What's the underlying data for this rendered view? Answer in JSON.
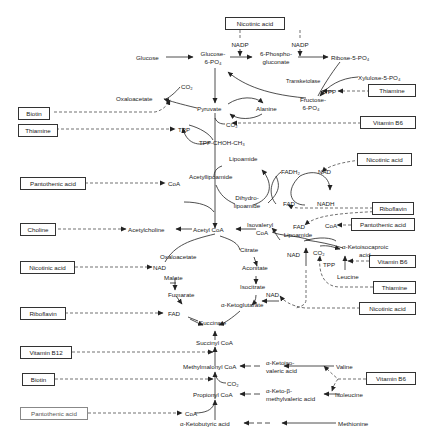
{
  "diagram": {
    "title": "",
    "vitamins": [
      {
        "id": "niacin_top",
        "label": "Nicotinic acid"
      },
      {
        "id": "biotin_1",
        "label": "Biotin"
      },
      {
        "id": "thiamine_1",
        "label": "Thiamine"
      },
      {
        "id": "thiamine_2",
        "label": "Thiamine"
      },
      {
        "id": "b6_1",
        "label": "Vitamin B6"
      },
      {
        "id": "pantothenic_1",
        "label": "Pantothenic acid"
      },
      {
        "id": "niacin_2",
        "label": "Nicotinic acid"
      },
      {
        "id": "choline",
        "label": "Choline"
      },
      {
        "id": "riboflavin_1",
        "label": "Riboflavin"
      },
      {
        "id": "pantothenic_2",
        "label": "Pantothenic acid"
      },
      {
        "id": "niacin_3",
        "label": "Nicotinic acid"
      },
      {
        "id": "b6_2",
        "label": "Vitamin B6"
      },
      {
        "id": "thiamine_3",
        "label": "Thiamine"
      },
      {
        "id": "niacin_4",
        "label": "Nicotinic acid"
      },
      {
        "id": "riboflavin_2",
        "label": "Riboflavin"
      },
      {
        "id": "b12",
        "label": "Vitamin B12"
      },
      {
        "id": "biotin_2",
        "label": "Biotin"
      },
      {
        "id": "b6_3",
        "label": "Vitamin B6"
      },
      {
        "id": "pantothenic_3",
        "label": "Pantothenic acid"
      }
    ],
    "labels": {
      "nadp_1": "NADP",
      "nadp_2": "NADP",
      "glucose": "Glucose",
      "glucose6p_1": "Glucose-",
      "glucose6p_2": "6-PO₄",
      "phosphogluconate_1": "6-Phospho-",
      "phosphogluconate_2": "gluconate",
      "ribose5p": "Ribose-5-PO₄",
      "xylulose5p": "Xylulose-5-PO₄",
      "transketolase": "Transketolase",
      "tpp_transketolase": "TPP",
      "fructose6p_1": "Fructose-",
      "fructose6p_2": "6-PO₄",
      "co2_oxalo": "CO₂",
      "oxaloacetate_top": "Oxaloacetate",
      "pyruvate": "Pyruvate",
      "alanine": "Alanine",
      "tpp_1": "TPP",
      "co2_pyr": "CO₂",
      "tpp_choh": "TPP-CHOH-CH₃",
      "lipoamide": "Lipoamide",
      "acetyllipoamide": "Acetyllipoamide",
      "coa_1": "CoA",
      "dihydrolipoamide_1": "Dihydro-",
      "dihydrolipoamide_2": "lipoamide",
      "fadh2": "FADH₂",
      "nad_1": "NAD",
      "fad_1": "FAD",
      "nadh": "NADH",
      "acetylcholine": "Acetylcholine",
      "acetyl_coa": "Acetyl CoA",
      "isovaleryl_1": "Isovaleryl",
      "isovaleryl_2": "CoA",
      "fad_lipo_1": "FAD",
      "fad_lipo_2": "Lipoamide",
      "coa_2": "CoA",
      "ketoisocaproic_1": "α-Ketoisocaproic",
      "ketoisocaproic_2": "acid",
      "co2_leu": "CO₂",
      "nad_leu": "NAD",
      "tpp_leu": "TPP",
      "leucine": "Leucine",
      "oxaloacetate_tca": "Oxaloacetate",
      "citrate": "Citrate",
      "nad_malate": "NAD",
      "malate": "Malate",
      "aconitate": "Aconitate",
      "isocitrate": "Isocitrate",
      "nad_iso": "NAD",
      "fumarate": "Fumarate",
      "ketoglutarate": "α-Ketoglutarate",
      "fad_succ": "FAD",
      "succinate": "Succinate",
      "succinyl_coa": "Succinyl CoA",
      "methylmalonyl_coa": "Methylmalonyl CoA",
      "ketoisovaleric_1": "α-Ketoiso-",
      "ketoisovaleric_2": "valeric acid",
      "valine": "Valine",
      "co2_mm": "CO₂",
      "propionyl_coa": "Propionyl CoA",
      "ketomethylvaleric_1": "α-Keto-β-",
      "ketomethylvaleric_2": "methylvaleric acid",
      "isoleucine": "Isoleucine",
      "coa_3": "CoA",
      "ketobutyric": "α-Ketobutyric acid",
      "methionine": "Methionine"
    }
  }
}
